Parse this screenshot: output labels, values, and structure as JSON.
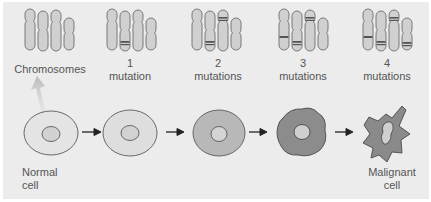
{
  "stages": [
    {
      "label_line1": "Chromosomes",
      "label_line2": "",
      "mutations": 0
    },
    {
      "label_line1": "1",
      "label_line2": "mutation",
      "mutations": 1
    },
    {
      "label_line1": "2",
      "label_line2": "mutations",
      "mutations": 2
    },
    {
      "label_line1": "3",
      "label_line2": "mutations",
      "mutations": 3
    },
    {
      "label_line1": "4",
      "label_line2": "mutations",
      "mutations": 4
    }
  ],
  "cells": [
    {
      "label_line1": "Normal",
      "label_line2": "cell"
    },
    {
      "label_line1": "",
      "label_line2": ""
    },
    {
      "label_line1": "",
      "label_line2": ""
    },
    {
      "label_line1": "",
      "label_line2": ""
    },
    {
      "label_line1": "Malignant",
      "label_line2": "cell"
    }
  ],
  "colors": {
    "background": "#ececec",
    "chromosome_fill": "#d0d0d0",
    "chromosome_stroke": "#6e6e6e",
    "mutation_band": "#555555",
    "cell_light": "#e2e2e2",
    "cell_medium": "#b8b8b8",
    "cell_dark": "#8a8a8a",
    "cell_outline": "#5a5a5a",
    "arrow": "#222222",
    "text": "#555555"
  }
}
